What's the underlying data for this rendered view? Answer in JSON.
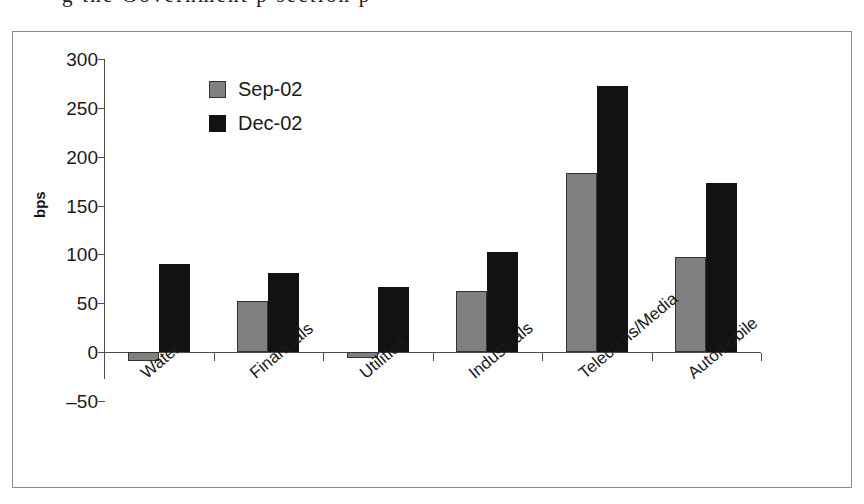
{
  "top_text_fragment": "g the Government  p    section  p",
  "chart_data": {
    "type": "bar",
    "title": "",
    "subtitle": "",
    "xlabel": "",
    "ylabel": "bps",
    "ylim": [
      -50,
      300
    ],
    "ytick_step": 50,
    "ytick_labels": [
      "300",
      "250",
      "200",
      "150",
      "100",
      "50",
      "0",
      "–50"
    ],
    "ytick_values": [
      300,
      250,
      200,
      150,
      100,
      50,
      0,
      -50
    ],
    "grid": false,
    "legend_position": "upper-left-inside",
    "categories": [
      "Water",
      "Financials",
      "Utilities",
      "Industrials",
      "Telecoms/Media",
      "Automobile"
    ],
    "series": [
      {
        "name": "Sep-02",
        "color": "#808080",
        "values": [
          -9,
          52,
          -6,
          62,
          183,
          97
        ]
      },
      {
        "name": "Dec-02",
        "color": "#121212",
        "values": [
          90,
          81,
          67,
          102,
          272,
          173
        ]
      }
    ]
  }
}
